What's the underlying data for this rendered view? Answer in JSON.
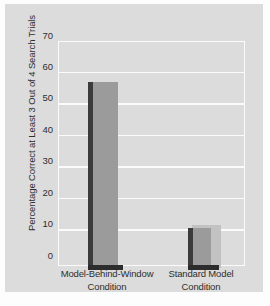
{
  "chart_data": {
    "type": "bar",
    "title": "",
    "xlabel": "",
    "ylabel": "Percentage Correct at Least 3 Out of 4 Search Trials",
    "categories": [
      "Model-Behind-Window Condition",
      "Standard Model Condition"
    ],
    "category_lines": [
      [
        "Model-Behind-Window",
        "Condition"
      ],
      [
        "Standard Model",
        "Condition"
      ]
    ],
    "values": [
      57.5,
      11.5
    ],
    "ylim": [
      0,
      70
    ],
    "yticks": [
      0,
      10,
      20,
      30,
      40,
      50,
      60,
      70
    ],
    "ytick_labels": [
      "0",
      "10",
      "20",
      "30",
      "40",
      "50",
      "60",
      "70"
    ],
    "grid": true,
    "legend": "none",
    "colors": {
      "figure_background": "#dcdcdc",
      "plot_background": "#dcdcdc",
      "gridline": "#fbfbfb",
      "bar_face": "#9b9b9b",
      "bar_shadow": "#3b3b3b",
      "bar_halo": "#c2c2c2",
      "text": "#2e2e2e",
      "page_background": "#fdfdfd"
    }
  }
}
